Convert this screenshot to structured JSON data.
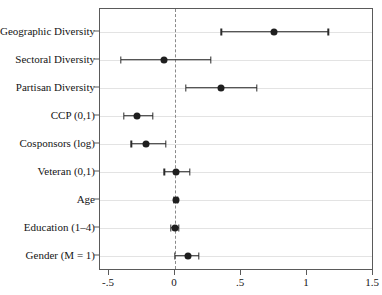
{
  "figure": {
    "title": "",
    "title_note": "cropped-off title above plot frame"
  },
  "chart_data": {
    "type": "scatter",
    "subtype": "coefficient-plot",
    "title": "",
    "xlabel": "",
    "ylabel": "",
    "xlim": [
      -0.6,
      1.55
    ],
    "xticks": [
      -0.5,
      0,
      0.5,
      1,
      1.5
    ],
    "xtick_labels": [
      "-.5",
      "0",
      ".5",
      "1",
      "1.5"
    ],
    "grid": "horizontal",
    "reference_line": {
      "x": 0,
      "style": "dashed"
    },
    "legend": null,
    "categories": [
      "Geographic Diversity",
      "Sectoral Diversity",
      "Partisan Diversity",
      "CCP (0,1)",
      "Cosponsors (log)",
      "Veteran (0,1)",
      "Age",
      "Education (1–4)",
      "Gender (M = 1)"
    ],
    "estimates": [
      0.75,
      -0.08,
      0.35,
      -0.29,
      -0.22,
      0.01,
      0.01,
      0.0,
      0.1
    ],
    "ci_low": [
      0.35,
      -0.41,
      0.08,
      -0.39,
      -0.33,
      -0.08,
      -0.01,
      -0.03,
      0.0
    ],
    "ci_high": [
      1.16,
      0.27,
      0.62,
      -0.17,
      -0.07,
      0.11,
      0.02,
      0.03,
      0.18
    ],
    "points": [
      {
        "label": "Geographic Diversity",
        "estimate": 0.75,
        "ci_low": 0.35,
        "ci_high": 1.16
      },
      {
        "label": "Sectoral Diversity",
        "estimate": -0.08,
        "ci_low": -0.41,
        "ci_high": 0.27
      },
      {
        "label": "Partisan Diversity",
        "estimate": 0.35,
        "ci_low": 0.08,
        "ci_high": 0.62
      },
      {
        "label": "CCP (0,1)",
        "estimate": -0.29,
        "ci_low": -0.39,
        "ci_high": -0.17
      },
      {
        "label": "Cosponsors (log)",
        "estimate": -0.22,
        "ci_low": -0.33,
        "ci_high": -0.07
      },
      {
        "label": "Veteran (0,1)",
        "estimate": 0.01,
        "ci_low": -0.08,
        "ci_high": 0.11
      },
      {
        "label": "Age",
        "estimate": 0.01,
        "ci_low": -0.01,
        "ci_high": 0.02
      },
      {
        "label": "Education (1–4)",
        "estimate": 0.0,
        "ci_low": -0.03,
        "ci_high": 0.03
      },
      {
        "label": "Gender (M = 1)",
        "estimate": 0.1,
        "ci_low": 0.0,
        "ci_high": 0.18
      }
    ],
    "colors": {
      "point": "#1f1f1f",
      "interval": "#2b2b2b",
      "gridline": "#e3e3e3",
      "frame": "#5a5a5a",
      "zero_line": "#8a8a8a",
      "background": "#ffffff"
    }
  }
}
